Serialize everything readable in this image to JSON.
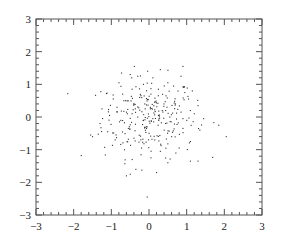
{
  "chart_data": {
    "type": "scatter",
    "title": "",
    "xlabel": "",
    "ylabel": "",
    "xlim": [
      -3,
      3
    ],
    "ylim": [
      -3,
      3
    ],
    "grid": false,
    "legend": null,
    "x_ticks": [
      -3,
      -2,
      -1,
      0,
      1,
      2,
      3
    ],
    "y_ticks": [
      -3,
      -2,
      -1,
      0,
      1,
      2,
      3
    ],
    "x_tick_labels": [
      "−3",
      "−2",
      "−1",
      "0",
      "1",
      "2",
      "3"
    ],
    "y_tick_labels": [
      "−3",
      "−2",
      "−1",
      "0",
      "1",
      "2",
      "3"
    ],
    "minor_ticks_per_major": 5,
    "marker": "dot",
    "marker_color": "#333333",
    "n_points_approx": 300,
    "distribution": "bivariate standard normal, centered near (0,0)",
    "series": [
      {
        "name": "points",
        "points": [
          [
            -1.13,
            0.72
          ],
          [
            -1.16,
            -1.16
          ],
          [
            -1.8,
            -1.18
          ],
          [
            -1.55,
            -0.55
          ],
          [
            -1.5,
            -0.6
          ],
          [
            1.85,
            -0.25
          ],
          [
            2.05,
            -0.6
          ],
          [
            1.1,
            -1.35
          ],
          [
            1.3,
            -1.35
          ],
          [
            -0.05,
            -2.45
          ],
          [
            0.9,
            1.55
          ],
          [
            0.85,
            1.25
          ],
          [
            -0.5,
            1.3
          ],
          [
            0.3,
            1.45
          ],
          [
            -0.3,
            1.25
          ],
          [
            0.1,
            1.2
          ],
          [
            0.5,
            1.05
          ],
          [
            -0.8,
            1.05
          ],
          [
            -0.15,
            1.0
          ],
          [
            0.65,
            0.95
          ],
          [
            -0.95,
            0.55
          ],
          [
            -0.45,
            0.85
          ],
          [
            0.25,
            0.85
          ],
          [
            0.95,
            0.75
          ],
          [
            1.15,
            0.8
          ],
          [
            -0.7,
            0.7
          ],
          [
            0.05,
            0.7
          ],
          [
            0.45,
            0.65
          ],
          [
            -0.25,
            0.6
          ],
          [
            1.05,
            0.55
          ],
          [
            -1.25,
            0.25
          ],
          [
            -0.85,
            0.3
          ],
          [
            -0.4,
            0.4
          ],
          [
            0.15,
            0.45
          ],
          [
            0.7,
            0.4
          ],
          [
            1.3,
            0.35
          ],
          [
            -1.05,
            0.05
          ],
          [
            -0.6,
            0.15
          ],
          [
            -0.1,
            0.25
          ],
          [
            0.35,
            0.2
          ],
          [
            0.85,
            0.15
          ],
          [
            1.2,
            0.1
          ],
          [
            -1.3,
            -0.2
          ],
          [
            -0.75,
            -0.1
          ],
          [
            -0.3,
            0.0
          ],
          [
            0.1,
            -0.05
          ],
          [
            0.55,
            0.0
          ],
          [
            1.0,
            -0.1
          ],
          [
            1.45,
            -0.05
          ],
          [
            -1.1,
            -0.45
          ],
          [
            -0.55,
            -0.35
          ],
          [
            -0.05,
            -0.3
          ],
          [
            0.4,
            -0.4
          ],
          [
            0.9,
            -0.35
          ],
          [
            1.35,
            -0.4
          ],
          [
            -0.9,
            -0.7
          ],
          [
            -0.4,
            -0.65
          ],
          [
            0.15,
            -0.7
          ],
          [
            0.6,
            -0.6
          ],
          [
            1.1,
            -0.75
          ],
          [
            -0.65,
            -1.0
          ],
          [
            -0.2,
            -0.95
          ],
          [
            0.3,
            -1.05
          ],
          [
            0.8,
            -0.95
          ],
          [
            -0.45,
            -1.3
          ],
          [
            0.05,
            -1.25
          ],
          [
            0.5,
            -1.4
          ],
          [
            -0.35,
            -1.6
          ],
          [
            0.2,
            -1.7
          ],
          [
            -0.6,
            -1.8
          ],
          [
            -0.5,
            -1.75
          ],
          [
            0.0,
            -0.5
          ],
          [
            -0.15,
            -0.1
          ],
          [
            0.25,
            0.05
          ],
          [
            -0.45,
            0.1
          ]
        ]
      }
    ]
  }
}
